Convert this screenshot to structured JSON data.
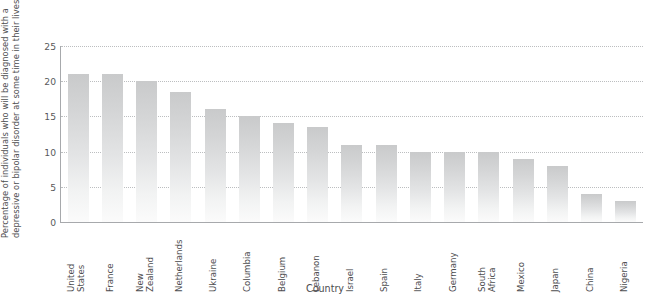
{
  "chart_data": {
    "type": "bar",
    "title": "",
    "xlabel": "Country",
    "ylabel_line1": "Percentage of individuals who will be diagnosed with a",
    "ylabel_line2": "depressive or bipolar disorder at some time in their lives",
    "ylabel": "Percentage of individuals who will be diagnosed with a depressive or bipolar disorder at some time in their lives",
    "ylim": [
      0,
      25
    ],
    "ytick_labels": [
      "0",
      "5",
      "10",
      "15",
      "20",
      "25"
    ],
    "ytick_values": [
      0,
      5,
      10,
      15,
      20,
      25
    ],
    "grid": "horizontal-dotted",
    "legend": "none",
    "bar_color": "#d2d3d4",
    "categories": [
      "United States",
      "France",
      "New Zealand",
      "Netherlands",
      "Ukraine",
      "Columbia",
      "Belgium",
      "Lebanon",
      "Israel",
      "Spain",
      "Italy",
      "Germany",
      "South Africa",
      "Mexico",
      "Japan",
      "China",
      "Nigeria"
    ],
    "category_lines": [
      [
        "United",
        "States"
      ],
      [
        "France"
      ],
      [
        "New",
        "Zealand"
      ],
      [
        "Netherlands"
      ],
      [
        "Ukraine"
      ],
      [
        "Columbia"
      ],
      [
        "Belgium"
      ],
      [
        "Lebanon"
      ],
      [
        "Israel"
      ],
      [
        "Spain"
      ],
      [
        "Italy"
      ],
      [
        "Germany"
      ],
      [
        "South",
        "Africa"
      ],
      [
        "Mexico"
      ],
      [
        "Japan"
      ],
      [
        "China"
      ],
      [
        "Nigeria"
      ]
    ],
    "values": [
      21,
      21,
      20,
      18.4,
      16,
      15,
      14,
      13.5,
      11,
      11,
      10,
      10,
      10,
      9,
      8,
      4,
      3
    ]
  }
}
